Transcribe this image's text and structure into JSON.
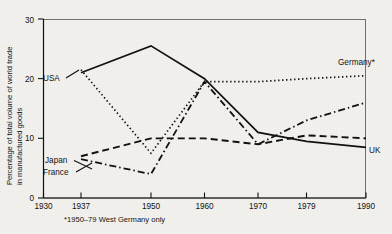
{
  "chart_data": {
    "type": "line",
    "title": "",
    "xlabel": "",
    "ylabel": "Percentage of total volume of world trade in manufactured goods",
    "ylabel_line1": "Percentage of total volume of world trade",
    "ylabel_line2": "in manufactured goods",
    "x": [
      1930,
      1937,
      1950,
      1960,
      1970,
      1979,
      1990
    ],
    "xtick_labels": [
      "1930",
      "1937",
      "1950",
      "1960",
      "1970",
      "1979",
      "1990"
    ],
    "ytick_labels": [
      "0",
      "10",
      "20",
      "30"
    ],
    "yticks": [
      0,
      10,
      20,
      30
    ],
    "ylim": [
      0,
      30
    ],
    "xlim": [
      1930,
      1990
    ],
    "grid": false,
    "legend_position": "inline-labels",
    "annotation": "*1950–79 West Germany only",
    "series": [
      {
        "name": "USA",
        "label": "USA",
        "style": "solid",
        "label_side": "left",
        "points": [
          {
            "x": 1937,
            "y": 21.0
          },
          {
            "x": 1950,
            "y": 25.5
          },
          {
            "x": 1960,
            "y": 20.0
          },
          {
            "x": 1970,
            "y": 11.0
          },
          {
            "x": 1979,
            "y": 9.5
          },
          {
            "x": 1990,
            "y": 8.5
          }
        ]
      },
      {
        "name": "Germany",
        "label": "Germany*",
        "style": "dotted",
        "label_side": "right",
        "points": [
          {
            "x": 1937,
            "y": 21.5
          },
          {
            "x": 1950,
            "y": 7.5
          },
          {
            "x": 1960,
            "y": 19.5
          },
          {
            "x": 1970,
            "y": 19.5
          },
          {
            "x": 1979,
            "y": 20.0
          },
          {
            "x": 1990,
            "y": 20.5
          }
        ]
      },
      {
        "name": "France",
        "label": "France",
        "style": "dashdot",
        "label_side": "left",
        "points": [
          {
            "x": 1937,
            "y": 6.5
          },
          {
            "x": 1950,
            "y": 4.0
          },
          {
            "x": 1960,
            "y": 19.5
          },
          {
            "x": 1970,
            "y": 9.0
          },
          {
            "x": 1979,
            "y": 13.0
          },
          {
            "x": 1990,
            "y": 16.0
          }
        ]
      },
      {
        "name": "Japan",
        "label": "Japan",
        "style": "dashed",
        "label_side": "left",
        "points": [
          {
            "x": 1937,
            "y": 7.0
          },
          {
            "x": 1950,
            "y": 10.0
          },
          {
            "x": 1960,
            "y": 10.0
          },
          {
            "x": 1970,
            "y": 9.0
          },
          {
            "x": 1979,
            "y": 10.5
          },
          {
            "x": 1990,
            "y": 10.0
          }
        ]
      }
    ]
  },
  "labels": {
    "usa": "USA",
    "germany": "Germany*",
    "france": "France",
    "japan": "Japan",
    "uk": "UK"
  },
  "footnote": "*1950–79 West Germany only",
  "axis": {
    "y_title_line1": "Percentage of total volume of world trade",
    "y_title_line2": "in manufactured goods",
    "y_ticks": [
      "0",
      "10",
      "20",
      "30"
    ],
    "x_ticks": [
      "1930",
      "1937",
      "1950",
      "1960",
      "1970",
      "1979",
      "1990"
    ]
  },
  "colors": {
    "ink": "#111111",
    "frame": "#6f6f6f",
    "paper": "#f2f1ee"
  }
}
